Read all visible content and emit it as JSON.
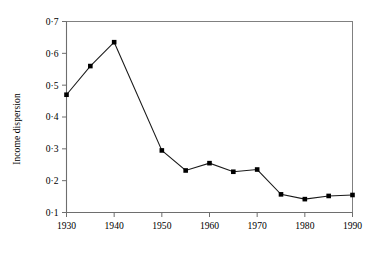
{
  "chart_data": {
    "type": "line",
    "title": "",
    "xlabel": "",
    "ylabel": "Income dispersion",
    "x": [
      1930,
      1935,
      1940,
      1950,
      1955,
      1960,
      1965,
      1970,
      1975,
      1980,
      1985,
      1990
    ],
    "values": [
      0.47,
      0.56,
      0.635,
      0.295,
      0.232,
      0.255,
      0.228,
      0.235,
      0.157,
      0.142,
      0.152,
      0.155
    ],
    "xlim": [
      1930,
      1990
    ],
    "ylim": [
      0.1,
      0.7
    ],
    "xticks": [
      1930,
      1940,
      1950,
      1960,
      1970,
      1980,
      1990
    ],
    "xtick_labels": [
      "1930",
      "1940",
      "1950",
      "1960",
      "1970",
      "1980",
      "1990"
    ],
    "yticks": [
      0.1,
      0.2,
      0.3,
      0.4,
      0.5,
      0.6,
      0.7
    ],
    "ytick_labels": [
      "0·1",
      "0·2",
      "0·3",
      "0·4",
      "0·5",
      "0·6",
      "0·7"
    ],
    "grid": false,
    "legend": null,
    "marker": "square",
    "line_color": "#1a1a1a",
    "marker_color": "#000000",
    "axis_color": "#808080",
    "background": "#ffffff"
  }
}
